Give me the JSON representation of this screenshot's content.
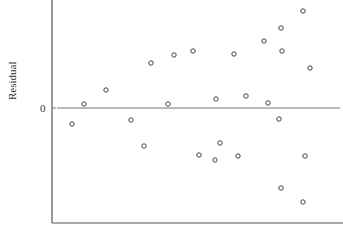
{
  "chart_data": {
    "type": "scatter",
    "title": "",
    "xlabel": "",
    "ylabel": "Residual",
    "yticks": [
      "0"
    ],
    "grid": false,
    "reference_line": {
      "y": 0,
      "label": "0"
    },
    "marker": "open-circle",
    "points_px": [
      [
        84,
        104
      ],
      [
        72,
        124
      ],
      [
        106,
        90
      ],
      [
        131,
        120
      ],
      [
        144,
        146
      ],
      [
        151,
        63
      ],
      [
        168,
        104
      ],
      [
        174,
        55
      ],
      [
        193,
        51
      ],
      [
        199,
        155
      ],
      [
        216,
        99
      ],
      [
        215,
        160
      ],
      [
        220,
        143
      ],
      [
        234,
        54
      ],
      [
        238,
        156
      ],
      [
        246,
        96
      ],
      [
        264,
        41
      ],
      [
        268,
        103
      ],
      [
        281,
        28
      ],
      [
        282,
        51
      ],
      [
        279,
        119
      ],
      [
        281,
        188
      ],
      [
        303,
        11
      ],
      [
        305,
        156
      ],
      [
        310,
        68
      ],
      [
        303,
        202
      ]
    ],
    "note": "Residuals scattered around zero with increasing spread (fan shape) as x increases"
  },
  "labels": {
    "ylabel": "Residual",
    "zero": "0"
  }
}
